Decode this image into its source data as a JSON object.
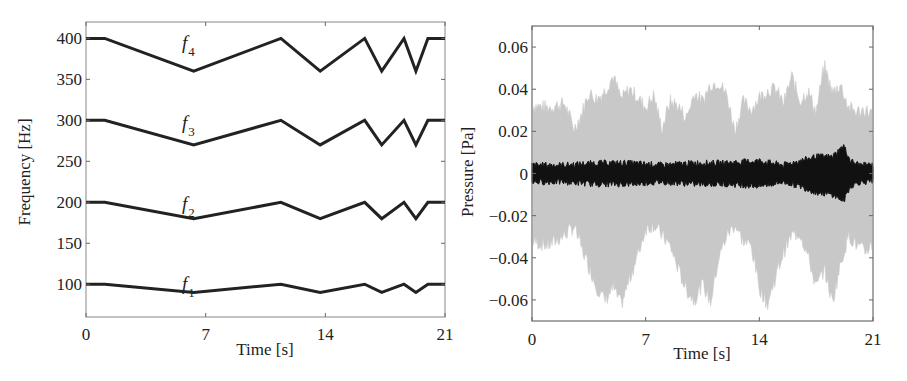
{
  "chart_data": [
    {
      "type": "line",
      "title": "",
      "xlabel": "Time [s]",
      "ylabel": "Frequency [Hz]",
      "xlim": [
        0,
        21
      ],
      "ylim": [
        60,
        420
      ],
      "xticks": [
        0,
        7,
        14,
        21
      ],
      "yticks": [
        100,
        150,
        200,
        250,
        300,
        350,
        400
      ],
      "grid": false,
      "legend": "none (inline labels)",
      "x": [
        0,
        1.1,
        6.3,
        11.4,
        13.7,
        16.3,
        17.3,
        18.6,
        19.3,
        20.0,
        21
      ],
      "series": [
        {
          "name": "f4",
          "label_sub": "4",
          "values": [
            400,
            400,
            360,
            400,
            360,
            400,
            360,
            400,
            360,
            400,
            400
          ]
        },
        {
          "name": "f3",
          "label_sub": "3",
          "values": [
            300,
            300,
            270,
            300,
            270,
            300,
            270,
            300,
            270,
            300,
            300
          ]
        },
        {
          "name": "f2",
          "label_sub": "2",
          "values": [
            200,
            200,
            180,
            200,
            180,
            200,
            180,
            200,
            180,
            200,
            200
          ]
        },
        {
          "name": "f1",
          "label_sub": "1",
          "values": [
            100,
            100,
            90,
            100,
            90,
            100,
            90,
            100,
            90,
            100,
            100
          ]
        }
      ]
    },
    {
      "type": "area",
      "title": "",
      "xlabel": "Time [s]",
      "ylabel": "Pressure [Pa]",
      "xlim": [
        0,
        21
      ],
      "ylim": [
        -0.07,
        0.07
      ],
      "xticks": [
        0,
        7,
        14,
        21
      ],
      "yticks": [
        -0.06,
        -0.04,
        -0.02,
        0,
        0.02,
        0.04,
        0.06
      ],
      "ytick_labels": [
        "−0.06",
        "−0.04",
        "−0.02",
        "0",
        "0.02",
        "0.04",
        "0.06"
      ],
      "grid": false,
      "series": [
        {
          "name": "signal (gray envelope)",
          "color": "#c8c8c8",
          "x": [
            0,
            1,
            2,
            2.6,
            3,
            3.5,
            4,
            4.5,
            5,
            5.5,
            6,
            6.5,
            7,
            7.5,
            8,
            8.5,
            9,
            9.5,
            10,
            10.5,
            11,
            11.5,
            12,
            12.5,
            13,
            13.5,
            14,
            14.5,
            15,
            15.5,
            16,
            16.5,
            17,
            17.5,
            18,
            18.5,
            19,
            19.5,
            20,
            20.5,
            21
          ],
          "upper": [
            0.033,
            0.032,
            0.034,
            0.022,
            0.028,
            0.039,
            0.036,
            0.04,
            0.047,
            0.036,
            0.041,
            0.037,
            0.032,
            0.038,
            0.022,
            0.035,
            0.033,
            0.027,
            0.039,
            0.035,
            0.043,
            0.044,
            0.038,
            0.021,
            0.035,
            0.031,
            0.037,
            0.04,
            0.041,
            0.034,
            0.047,
            0.035,
            0.04,
            0.03,
            0.052,
            0.039,
            0.043,
            0.032,
            0.03,
            0.031,
            0.029
          ],
          "lower": [
            -0.033,
            -0.035,
            -0.03,
            -0.026,
            -0.035,
            -0.045,
            -0.055,
            -0.061,
            -0.055,
            -0.063,
            -0.051,
            -0.04,
            -0.027,
            -0.025,
            -0.03,
            -0.035,
            -0.046,
            -0.056,
            -0.061,
            -0.053,
            -0.062,
            -0.041,
            -0.03,
            -0.025,
            -0.033,
            -0.035,
            -0.055,
            -0.063,
            -0.05,
            -0.038,
            -0.03,
            -0.029,
            -0.04,
            -0.055,
            -0.046,
            -0.062,
            -0.044,
            -0.03,
            -0.035,
            -0.038,
            -0.034
          ]
        },
        {
          "name": "signal (black trace)",
          "color": "#111111",
          "x": [
            0,
            2,
            4,
            6,
            8,
            10,
            12,
            14,
            15.5,
            16.5,
            17.5,
            18.5,
            19.2,
            19.6,
            20.2,
            21
          ],
          "upper": [
            0.004,
            0.004,
            0.005,
            0.005,
            0.004,
            0.005,
            0.005,
            0.006,
            0.004,
            0.006,
            0.008,
            0.008,
            0.013,
            0.006,
            0.004,
            0.004
          ],
          "lower": [
            -0.004,
            -0.004,
            -0.005,
            -0.005,
            -0.004,
            -0.005,
            -0.005,
            -0.006,
            -0.004,
            -0.006,
            -0.009,
            -0.01,
            -0.013,
            -0.006,
            -0.004,
            -0.004
          ]
        }
      ]
    }
  ],
  "left": {
    "ylabel": "Frequency [Hz]",
    "xlabel": "Time [s]",
    "yticks": [
      "100",
      "150",
      "200",
      "250",
      "300",
      "350",
      "400"
    ],
    "xticks": [
      "0",
      "7",
      "14",
      "21"
    ],
    "series_label_base": "f",
    "series_subs": [
      "4",
      "3",
      "2",
      "1"
    ]
  },
  "right": {
    "ylabel": "Pressure [Pa]",
    "xlabel": "Time [s]",
    "yticks": [
      "0.06",
      "0.04",
      "0.02",
      "0",
      "−0.02",
      "−0.04",
      "−0.06"
    ],
    "xticks": [
      "0",
      "7",
      "14",
      "21"
    ]
  }
}
